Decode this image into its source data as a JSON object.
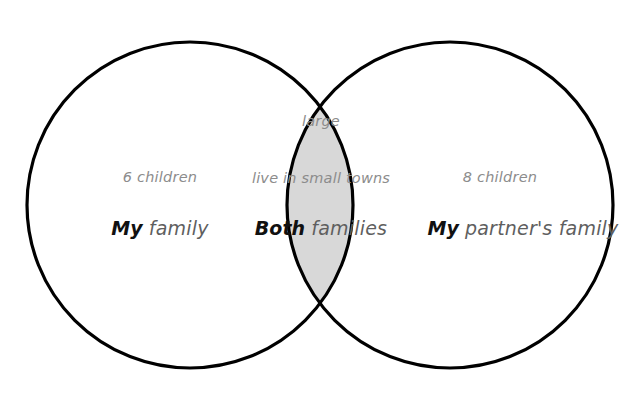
{
  "diagram": {
    "type": "venn",
    "shape": "two-circle",
    "background_color": "#ffffff",
    "stroke_color": "#000000",
    "overlap_fill_color": "#d8d8d8",
    "attribute_text_color": "#8c8c8c",
    "caption_text_color": "#5f5f5f",
    "emphasis_text_color": "#111111"
  },
  "left_set": {
    "name": "my-family",
    "attributes": [
      "6 children"
    ],
    "caption_emphasis": "My",
    "caption_rest": "family"
  },
  "intersection_set": {
    "name": "both-families",
    "attributes": [
      "large",
      "live in small towns"
    ],
    "caption_emphasis": "Both",
    "caption_rest": "families"
  },
  "right_set": {
    "name": "my-partners-family",
    "attributes": [
      "8 children"
    ],
    "caption_emphasis": "My",
    "caption_rest": "partner's family"
  }
}
